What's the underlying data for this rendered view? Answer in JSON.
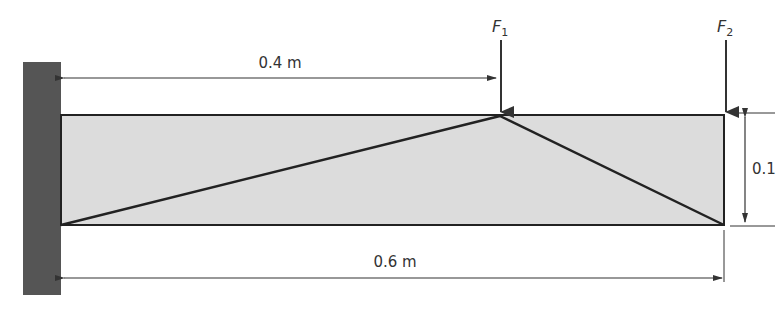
{
  "diagram": {
    "type": "cantilever beam with truss",
    "forces": [
      {
        "label": "F",
        "subscript": "1",
        "position_m": 0.4
      },
      {
        "label": "F",
        "subscript": "2",
        "position_m": 0.6
      }
    ],
    "dimensions": {
      "f1_distance": "0.4 m",
      "beam_length": "0.6 m",
      "beam_height": "0.1"
    },
    "colors": {
      "wall": "#555555",
      "beam_fill": "#dcdcdc",
      "line": "#222222"
    }
  }
}
